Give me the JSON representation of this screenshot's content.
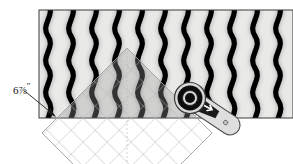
{
  "diagram": {
    "annotations": [
      {
        "name": "measurement-label",
        "whole": "6",
        "fraction": "7/8",
        "fraction_numerator": "7",
        "fraction_denominator": "8",
        "unit": "″",
        "text": "6⅞″",
        "points_to": "lower-left corner of fabric rectangle"
      }
    ],
    "fabric": {
      "name": "striped-fabric-panel",
      "x": 39,
      "y": 10,
      "width": 254,
      "height": 108,
      "background_color": "#e8e8e6",
      "border_color": "#3a3a3a",
      "stripe_color": "#000000",
      "stripe_count": 11,
      "stripe_spacing": 23,
      "stripe_description": "vertical black wavy stripes with soft gray shadow"
    },
    "ruler": {
      "name": "square-quilting-ruler",
      "shape": "square rotated 45 degrees (diamond)",
      "center_x": 127,
      "center_y": 133,
      "half_diagonal": 85,
      "fill_color": "rgba(150,150,150,0.30)",
      "edge_color": "#9a9a9a",
      "grid_color": "#b9b9b9",
      "grid_spacing": 17,
      "grid_description": "translucent diamond grid lines parallel to ruler edges"
    },
    "cutter": {
      "name": "rotary-cutter",
      "blade_center_x": 190,
      "blade_center_y": 98,
      "blade_outer_radius": 15,
      "blade_hub_radius": 8,
      "blade_color": "#111111",
      "body_color": "#dcdcdc",
      "body_outline": "#4a4a4a",
      "handle_angle_deg": 28,
      "handle_length": 58,
      "label": "rotary cutter"
    },
    "leader": {
      "name": "leader-arrow",
      "from_x": 26,
      "from_y": 92,
      "to_x": 56,
      "to_y": 117,
      "color": "#333333"
    }
  }
}
